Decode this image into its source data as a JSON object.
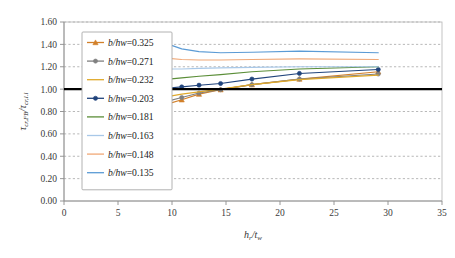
{
  "chart_data": {
    "type": "line",
    "title": "",
    "xlabel": "h_r/t_w",
    "xlabel_html": "h<sub>r</sub>/t<sub>w</sub>",
    "ylabel": "tau_cr,FB / tau_cr,l.l",
    "ylabel_html": "&tau;<sub>cr,FB</sub>/&tau;<sub>cr,l.l</sub>",
    "xlim": [
      0,
      35
    ],
    "ylim": [
      0.0,
      1.6
    ],
    "xticks": [
      "0",
      "5",
      "10",
      "15",
      "20",
      "25",
      "30",
      "35"
    ],
    "xtick_values": [
      0,
      5,
      10,
      15,
      20,
      25,
      30,
      35
    ],
    "yticks": [
      "0.00",
      "0.20",
      "0.40",
      "0.60",
      "0.80",
      "1.00",
      "1.20",
      "1.40",
      "1.60"
    ],
    "ytick_values": [
      0.0,
      0.2,
      0.4,
      0.6,
      0.8,
      1.0,
      1.2,
      1.4,
      1.6
    ],
    "grid": "horizontal-dashed",
    "legend_position": "upper-left-inside",
    "reference_line": {
      "name": "unity-reference-line",
      "y": 1.0,
      "color": "#000000",
      "label": ""
    },
    "x": [
      9.7,
      10.9,
      12.5,
      14.5,
      17.4,
      21.8,
      29.1
    ],
    "series": [
      {
        "name": "b/hw=0.325",
        "label": "b/hw=0.325",
        "label_prefix": "b/hw",
        "label_value": "=0.325",
        "color": "#D2802A",
        "marker": "triangle",
        "has_markers": true,
        "values": [
          0.87,
          0.905,
          0.955,
          0.995,
          1.04,
          1.09,
          1.155
        ]
      },
      {
        "name": "b/hw=0.271",
        "label": "b/hw=0.271",
        "label_prefix": "b/hw",
        "label_value": "=0.271",
        "color": "#808080",
        "marker": "circle",
        "has_markers": true,
        "values": [
          0.895,
          0.925,
          0.965,
          0.995,
          1.04,
          1.09,
          1.135
        ]
      },
      {
        "name": "b/hw=0.232",
        "label": "b/hw=0.232",
        "label_prefix": "b/hw",
        "label_value": "=0.232",
        "color": "#E0A92B",
        "marker": "none",
        "has_markers": false,
        "values": [
          0.935,
          0.955,
          0.975,
          1.0,
          1.04,
          1.085,
          1.125
        ]
      },
      {
        "name": "b/hw=0.203",
        "label": "b/hw=0.203",
        "label_prefix": "b/hw",
        "label_value": "=0.203",
        "color": "#21447C",
        "marker": "circle",
        "has_markers": true,
        "values": [
          1.01,
          1.02,
          1.035,
          1.05,
          1.09,
          1.14,
          1.175
        ]
      },
      {
        "name": "b/hw=0.181",
        "label": "b/hw=0.181",
        "label_prefix": "b/hw",
        "label_value": "=0.181",
        "color": "#5B8E38",
        "marker": "none",
        "has_markers": false,
        "values": [
          1.09,
          1.1,
          1.115,
          1.13,
          1.155,
          1.18,
          1.2
        ]
      },
      {
        "name": "b/hw=0.163",
        "label": "b/hw=0.163",
        "label_prefix": "b/hw",
        "label_value": "=0.163",
        "color": "#A8C8E8",
        "marker": "none",
        "has_markers": false,
        "values": [
          1.18,
          1.18,
          1.185,
          1.19,
          1.195,
          1.2,
          1.2
        ]
      },
      {
        "name": "b/hw=0.148",
        "label": "b/hw=0.148",
        "label_prefix": "b/hw",
        "label_value": "=0.148",
        "color": "#F0A877",
        "marker": "none",
        "has_markers": false,
        "values": [
          1.275,
          1.265,
          1.26,
          1.26,
          1.265,
          1.27,
          1.265
        ]
      },
      {
        "name": "b/hw=0.135",
        "label": "b/hw=0.135",
        "label_prefix": "b/hw",
        "label_value": "=0.135",
        "color": "#5B9BD5",
        "marker": "none",
        "has_markers": false,
        "values": [
          1.4,
          1.36,
          1.335,
          1.325,
          1.33,
          1.34,
          1.325
        ]
      }
    ]
  }
}
